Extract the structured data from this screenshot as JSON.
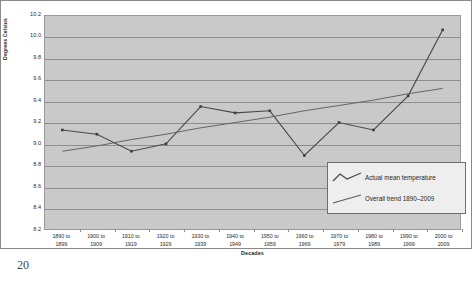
{
  "page": {
    "page_number": "20"
  },
  "chart_data": {
    "type": "line",
    "title": "",
    "xlabel": "Decades",
    "ylabel": "Degrees Celsius",
    "ylim": [
      8.2,
      10.2
    ],
    "ytick_step": 0.2,
    "yticks": [
      "10.2",
      "10.0",
      "9.8",
      "9.6",
      "9.4",
      "9.2",
      "9.0",
      "8.8",
      "8.6",
      "8.4",
      "8.2"
    ],
    "grid": true,
    "legend_position": "inside-bottom-right",
    "plot_background": "#c9c9c9",
    "series_color": "#4a4a4a",
    "categories": [
      "1890 to 1899",
      "1900 to 1909",
      "1910 to 1919",
      "1920 to 1929",
      "1930 to 1939",
      "1940 to 1949",
      "1950 to 1959",
      "1960 to 1969",
      "1970 to 1979",
      "1980 to 1989",
      "1990 to 1999",
      "2000 to 2009"
    ],
    "category_lines": [
      [
        "1890 to",
        "1899"
      ],
      [
        "1900 to",
        "1909"
      ],
      [
        "1910 to",
        "1919"
      ],
      [
        "1920 to",
        "1929"
      ],
      [
        "1930 to",
        "1939"
      ],
      [
        "1940 to",
        "1949"
      ],
      [
        "1950 to",
        "1959"
      ],
      [
        "1960 to",
        "1969"
      ],
      [
        "1970 to",
        "1979"
      ],
      [
        "1980 to",
        "1989"
      ],
      [
        "1990 to",
        "1999"
      ],
      [
        "2000 to",
        "2009"
      ]
    ],
    "series": [
      {
        "name": "Actual mean temperature",
        "marker": true,
        "values": [
          9.13,
          9.09,
          8.93,
          9.0,
          9.35,
          9.29,
          9.31,
          8.89,
          9.2,
          9.13,
          9.45,
          10.07
        ]
      },
      {
        "name": "Overall trend 1890–2009",
        "marker": false,
        "trend_endpoints": [
          8.93,
          9.52
        ],
        "values": [
          8.93,
          8.98,
          9.04,
          9.09,
          9.15,
          9.2,
          9.25,
          9.31,
          9.36,
          9.41,
          9.47,
          9.52
        ]
      }
    ],
    "legend": [
      {
        "label": "Actual mean temperature",
        "glyph": "zigzag-line"
      },
      {
        "label": "Overall trend 1890–2009",
        "glyph": "straight-line"
      }
    ]
  }
}
